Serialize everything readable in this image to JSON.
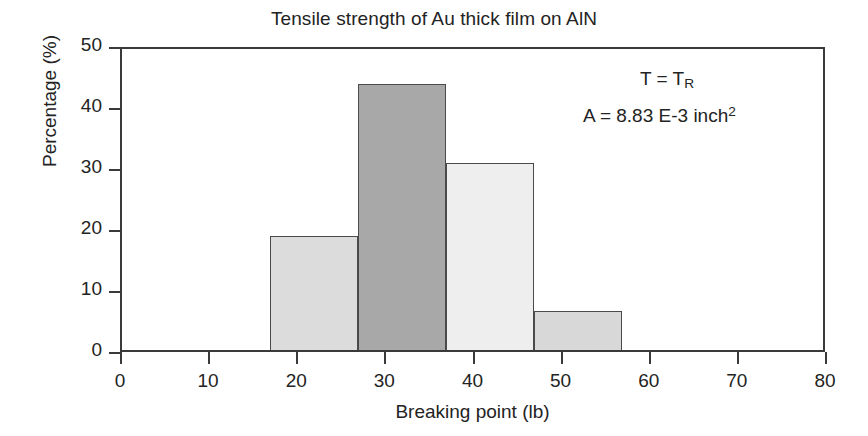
{
  "chart_data": {
    "type": "bar",
    "title": "Tensile strength of Au thick film on AlN",
    "xlabel": "Breaking point (lb)",
    "ylabel": "Percentage (%)",
    "xlim": [
      0,
      80
    ],
    "ylim": [
      0,
      50
    ],
    "grid": false,
    "legend": "none",
    "xticks": [
      "0",
      "10",
      "20",
      "30",
      "40",
      "50",
      "60",
      "70",
      "80"
    ],
    "xtick_values": [
      0,
      10,
      20,
      30,
      40,
      50,
      60,
      70,
      80
    ],
    "yticks": [
      "0",
      "10",
      "20",
      "30",
      "40",
      "50"
    ],
    "ytick_values": [
      0,
      10,
      20,
      30,
      40,
      50
    ],
    "bin_edges": [
      17,
      27,
      37,
      47,
      57
    ],
    "categories": [
      "17-27",
      "27-37",
      "37-47",
      "47-57"
    ],
    "values": [
      19,
      44,
      31,
      6.7
    ],
    "bar_colors": [
      "#dcdcdc",
      "#a8a8a8",
      "#eeeeee",
      "#d8d8d8"
    ],
    "bar_edge_color": "#4a4a4a",
    "axis_color": "#3a3a3a",
    "bars": [
      {
        "label": "bin-17-27",
        "x0": 17,
        "x1": 27,
        "value": 19,
        "color": "#dcdcdc"
      },
      {
        "label": "bin-27-37",
        "x0": 27,
        "x1": 37,
        "value": 44,
        "color": "#a8a8a8"
      },
      {
        "label": "bin-37-47",
        "x0": 37,
        "x1": 47,
        "value": 31,
        "color": "#eeeeee"
      },
      {
        "label": "bin-47-57",
        "x0": 47,
        "x1": 57,
        "value": 6.7,
        "color": "#d8d8d8"
      }
    ],
    "annotations": [
      {
        "id": "temperature",
        "text": "T = T_R",
        "base": "T = T",
        "sub": "R"
      },
      {
        "id": "area",
        "text": "A = 8.83 E-3 inch^2",
        "base": "A = 8.83 E-3 inch",
        "sup": "2"
      }
    ]
  }
}
